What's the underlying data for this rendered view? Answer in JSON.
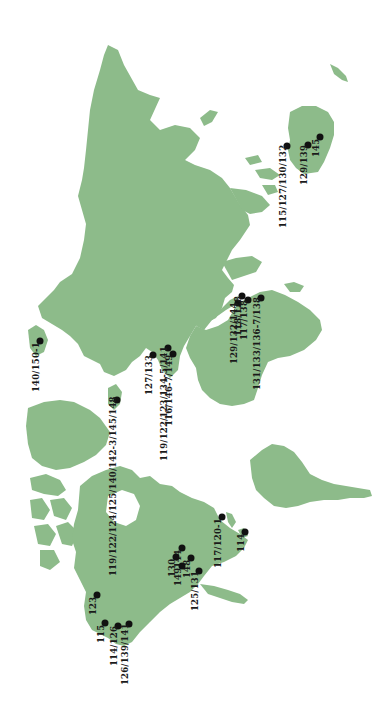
{
  "map": {
    "orientation": "rotated 90° counter-clockwise (north points left)",
    "land_color": "#8dbb8a",
    "background_color": "#ffffff",
    "marker_color": "#111111",
    "regions": [
      {
        "name": "Europe/Asia"
      },
      {
        "name": "Africa"
      },
      {
        "name": "Australia"
      },
      {
        "name": "North America"
      },
      {
        "name": "Greenland"
      },
      {
        "name": "South America"
      }
    ],
    "locations": [
      {
        "label": "140/150-1",
        "region": "Iceland",
        "x": 40,
        "y": 341
      },
      {
        "label": "119/122/124/125/140/142-3/145/148",
        "region": "British Isles",
        "x": 117,
        "y": 400
      },
      {
        "label": "127/133",
        "region": "Western Europe",
        "x": 153,
        "y": 355
      },
      {
        "label": "119/122/123/134-5/141",
        "region": "Central Europe",
        "x": 168,
        "y": 348
      },
      {
        "label": "116/146-7/149",
        "region": "Southern Europe",
        "x": 173,
        "y": 354
      },
      {
        "label": "129/132/144",
        "region": "East Africa",
        "x": 238,
        "y": 303
      },
      {
        "label": "118/128",
        "region": "East Africa",
        "x": 242,
        "y": 296
      },
      {
        "label": "117/138",
        "region": "East Africa",
        "x": 248,
        "y": 300
      },
      {
        "label": "131/133/136-7/138",
        "region": "Southern Africa",
        "x": 261,
        "y": 298
      },
      {
        "label": "115/127/130/132",
        "region": "Eastern Australia",
        "x": 287,
        "y": 146
      },
      {
        "label": "129/139",
        "region": "Eastern Australia",
        "x": 308,
        "y": 145
      },
      {
        "label": "145",
        "region": "Eastern Australia",
        "x": 320,
        "y": 137
      },
      {
        "label": "117/120-1",
        "region": "Caribbean",
        "x": 222,
        "y": 517
      },
      {
        "label": "114",
        "region": "Caribbean",
        "x": 245,
        "y": 532
      },
      {
        "label": "144",
        "region": "North America East",
        "x": 182,
        "y": 548
      },
      {
        "label": "148",
        "region": "North America East",
        "x": 191,
        "y": 558
      },
      {
        "label": "130",
        "region": "North America East",
        "x": 176,
        "y": 557
      },
      {
        "label": "149",
        "region": "North America East",
        "x": 182,
        "y": 566
      },
      {
        "label": "125/131",
        "region": "North America East",
        "x": 199,
        "y": 571
      },
      {
        "label": "123",
        "region": "North America West",
        "x": 97,
        "y": 595
      },
      {
        "label": "115",
        "region": "North America West",
        "x": 105,
        "y": 623
      },
      {
        "label": "114/126",
        "region": "North America West",
        "x": 118,
        "y": 626
      },
      {
        "label": "126/139/141",
        "region": "North America West",
        "x": 129,
        "y": 624
      }
    ]
  }
}
